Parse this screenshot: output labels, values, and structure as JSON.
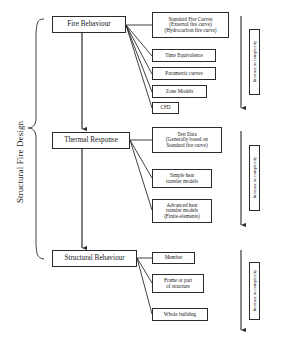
{
  "diagram": {
    "title_label": "Structural Fire Design",
    "stages": [
      {
        "id": "fire-behaviour",
        "label": "Fire Behaviour",
        "complexity_label": "Increase in complexity",
        "options": [
          {
            "id": "standard-fire-curves",
            "lines": [
              "Standard Fire Curves",
              "(External fire curve)",
              "(Hydrocarbon fire curve)"
            ]
          },
          {
            "id": "time-equivalence",
            "lines": [
              "Time Equivalence"
            ]
          },
          {
            "id": "parametric-curves",
            "lines": [
              "Parametric curves"
            ]
          },
          {
            "id": "zone-models",
            "lines": [
              "Zone Models"
            ]
          },
          {
            "id": "cfd",
            "lines": [
              "CFD"
            ]
          }
        ]
      },
      {
        "id": "thermal-response",
        "label": "Thermal Response",
        "complexity_label": "Increase in complexity",
        "options": [
          {
            "id": "test-data",
            "lines": [
              "Test Data",
              "(Generally based on",
              "Standard fire curve)"
            ]
          },
          {
            "id": "simple-heat-transfer-models",
            "lines": [
              "Simple heat",
              "transfer models"
            ]
          },
          {
            "id": "advanced-heat-transfer-models",
            "lines": [
              "Advanced heat",
              "transfer models",
              "(Finite-elements)"
            ]
          }
        ]
      },
      {
        "id": "structural-behaviour",
        "label": "Structural Behaviour",
        "complexity_label": "Increase in complexity",
        "options": [
          {
            "id": "member",
            "lines": [
              "Member"
            ]
          },
          {
            "id": "frame-or-part-of-structure",
            "lines": [
              "Frame or part",
              "of structure"
            ]
          },
          {
            "id": "whole-building",
            "lines": [
              "Whole building"
            ]
          }
        ]
      }
    ],
    "colors": {
      "stroke": "#2b2b2b",
      "background": "#ffffff",
      "text": "#1a1a1a"
    }
  }
}
